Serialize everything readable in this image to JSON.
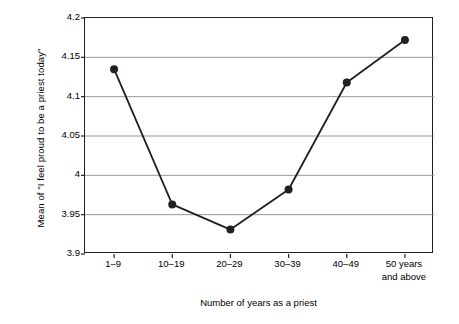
{
  "chart_data": {
    "type": "line",
    "title": "",
    "xlabel": "Number of years as a priest",
    "ylabel": "Mean of \"I feel proud to be a priest today\"",
    "categories": [
      "1–9",
      "10–19",
      "20–29",
      "30–39",
      "40–49",
      "50 years\nand above"
    ],
    "values": [
      4.135,
      3.963,
      3.931,
      3.982,
      4.118,
      4.172
    ],
    "ylim": [
      3.9,
      4.2
    ],
    "yticks": [
      3.9,
      3.95,
      4,
      4.05,
      4.1,
      4.15,
      4.2
    ],
    "ytick_labels": [
      "3.9",
      "3.95",
      "4",
      "4.05",
      "4.1",
      "4.15",
      "4.2"
    ],
    "grid": "horizontal",
    "legend": "none",
    "series": [
      {
        "name": "Mean of \"I feel proud to be a priest today\"",
        "values": [
          4.135,
          3.963,
          3.931,
          3.982,
          4.118,
          4.172
        ]
      }
    ],
    "colors": {
      "line": "#231f20",
      "marker": "#231f20",
      "grid": "#8c8c8c",
      "axis": "#231f20",
      "background": "#ffffff"
    },
    "marker": "circle",
    "line_width": 1.8,
    "marker_size": 4
  }
}
